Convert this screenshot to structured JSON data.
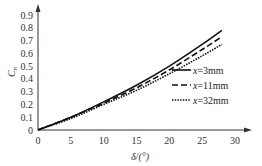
{
  "chart_data": {
    "type": "line",
    "title": "",
    "xlabel": "δ/(°)",
    "ylabel": "Cn",
    "ylabel_main": "C",
    "ylabel_sub": "n",
    "xlim": [
      0,
      30
    ],
    "ylim": [
      0,
      0.9
    ],
    "xticks": [
      "0",
      "5",
      "10",
      "15",
      "20",
      "25",
      "30"
    ],
    "yticks": [
      "0",
      "0.1",
      "0.2",
      "0.3",
      "0.4",
      "0.5",
      "0.6",
      "0.7",
      "0.8",
      "0.9"
    ],
    "grid": false,
    "legend_position": "right",
    "x": [
      0,
      5,
      10,
      15,
      20,
      25,
      28
    ],
    "series": [
      {
        "name": "x=3mm",
        "label_prefix": "x",
        "label_suffix": "=3mm",
        "style": "solid",
        "values": [
          0,
          0.1,
          0.22,
          0.35,
          0.5,
          0.67,
          0.78
        ]
      },
      {
        "name": "x=11mm",
        "label_prefix": "x",
        "label_suffix": "=11mm",
        "style": "dashed",
        "values": [
          0,
          0.1,
          0.21,
          0.33,
          0.47,
          0.63,
          0.73
        ]
      },
      {
        "name": "x=32mm",
        "label_prefix": "x",
        "label_suffix": "=32mm",
        "style": "dotted",
        "values": [
          0,
          0.09,
          0.2,
          0.31,
          0.44,
          0.58,
          0.67
        ]
      }
    ]
  }
}
